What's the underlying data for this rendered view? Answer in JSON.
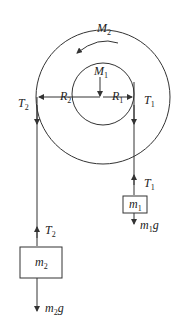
{
  "diagram": {
    "type": "pulley-system",
    "colors": {
      "stroke": "#333333",
      "text": "#222222",
      "background": "#ffffff"
    },
    "labels": {
      "M2": {
        "main": "M",
        "sub": "2"
      },
      "M1": {
        "main": "M",
        "sub": "1"
      },
      "R2": {
        "main": "R",
        "sub": "2"
      },
      "R1": {
        "main": "R",
        "sub": "1"
      },
      "T2_top": {
        "main": "T",
        "sub": "2"
      },
      "T1_top": {
        "main": "T",
        "sub": "1"
      },
      "T1_block": {
        "main": "T",
        "sub": "1"
      },
      "T2_block": {
        "main": "T",
        "sub": "2"
      },
      "m1": {
        "main": "m",
        "sub": "1"
      },
      "m2": {
        "main": "m",
        "sub": "2"
      },
      "m1g": {
        "main": "m",
        "sub": "1",
        "tail": "g"
      },
      "m2g": {
        "main": "m",
        "sub": "2",
        "tail": "g"
      }
    },
    "rotation_direction": "counterclockwise"
  }
}
